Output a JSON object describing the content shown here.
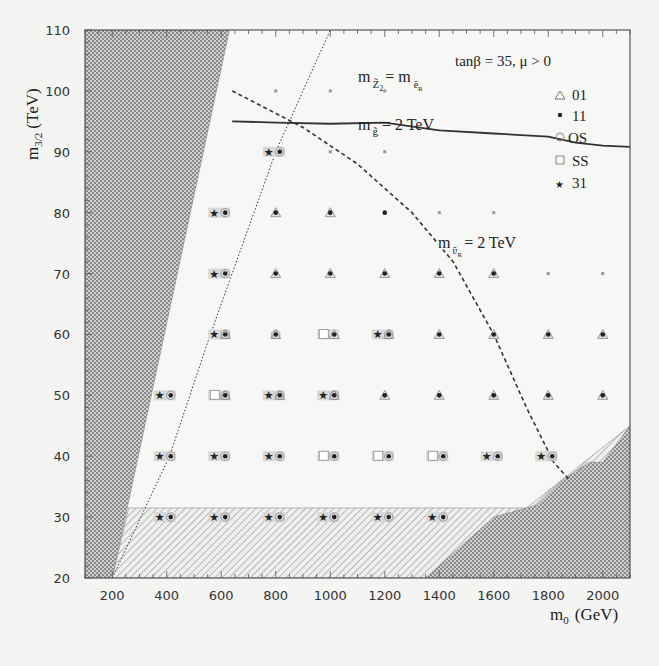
{
  "chart_data": {
    "type": "scatter",
    "title": "",
    "annotation_params": "tanβ = 35,  μ > 0",
    "xlabel": "m0 (GeV)",
    "ylabel": "m3/2 (TeV)",
    "xlim": [
      100,
      2100
    ],
    "ylim": [
      20,
      110
    ],
    "x_ticks": [
      200,
      400,
      600,
      800,
      1000,
      1200,
      1400,
      1600,
      1800,
      2000
    ],
    "y_ticks": [
      20,
      30,
      40,
      50,
      60,
      70,
      80,
      90,
      100,
      110
    ],
    "grid": false,
    "legend_position": "upper right",
    "legend": [
      {
        "symbol": "triangle-open",
        "label": "01"
      },
      {
        "symbol": "dot",
        "label": "11"
      },
      {
        "symbol": "circle-open",
        "label": "OS"
      },
      {
        "symbol": "square-open",
        "label": "SS"
      },
      {
        "symbol": "star",
        "label": "31"
      }
    ],
    "curve_labels": [
      {
        "text_main": "m",
        "sub": "Z̃2",
        "text_rest": "= m",
        "sub2": "ẽR",
        "position": [
          1000,
          103
        ]
      },
      {
        "text_main": "m",
        "sub": "g̃",
        "text_rest": "= 2 TeV",
        "position": [
          1000,
          96
        ]
      },
      {
        "text_main": "m",
        "sub": "ũR",
        "text_rest": "= 2 TeV",
        "position": [
          1380,
          74
        ]
      }
    ],
    "regions": [
      {
        "name": "theoretically excluded (left)",
        "fill": "crosshatch",
        "boundary": [
          [
            100,
            20
          ],
          [
            100,
            110
          ],
          [
            630,
            110
          ],
          [
            200,
            20
          ]
        ]
      },
      {
        "name": "experimentally excluded (bottom)",
        "fill": "diagonal-hatch",
        "boundary": [
          [
            200,
            20
          ],
          [
            260,
            31.5
          ],
          [
            1720,
            31.5
          ],
          [
            2100,
            45
          ],
          [
            2100,
            20
          ]
        ]
      },
      {
        "name": "theoretically excluded (bottom-right)",
        "fill": "crosshatch",
        "boundary": [
          [
            1350,
            20
          ],
          [
            1600,
            30
          ],
          [
            1760,
            32
          ],
          [
            1850,
            36
          ],
          [
            1950,
            39
          ],
          [
            2000,
            39
          ],
          [
            2050,
            42
          ],
          [
            2100,
            45
          ],
          [
            2100,
            20
          ]
        ]
      }
    ],
    "curves": [
      {
        "name": "m_gluino = 2 TeV",
        "style": "solid",
        "points": [
          [
            640,
            95
          ],
          [
            800,
            94.8
          ],
          [
            1000,
            94.6
          ],
          [
            1200,
            94.8
          ],
          [
            1400,
            93.5
          ],
          [
            1600,
            93
          ],
          [
            1800,
            92.5
          ],
          [
            1900,
            91.5
          ],
          [
            2000,
            91
          ],
          [
            2100,
            90.8
          ]
        ]
      },
      {
        "name": "m_uR = 2 TeV",
        "style": "dashed",
        "points": [
          [
            640,
            100
          ],
          [
            900,
            94
          ],
          [
            1100,
            88
          ],
          [
            1300,
            80
          ],
          [
            1450,
            72
          ],
          [
            1600,
            60
          ],
          [
            1720,
            48
          ],
          [
            1820,
            39
          ],
          [
            1880,
            36
          ]
        ]
      },
      {
        "name": "m_Z2 = m_eR",
        "style": "dotted",
        "points": [
          [
            200,
            20
          ],
          [
            410,
            40
          ],
          [
            560,
            60
          ],
          [
            800,
            90
          ],
          [
            1000,
            110
          ]
        ]
      }
    ],
    "series": [
      {
        "name": "signals",
        "points": [
          {
            "x": 800,
            "y": 100,
            "s": [
              "x"
            ]
          },
          {
            "x": 1000,
            "y": 100,
            "s": [
              "x"
            ]
          },
          {
            "x": 1200,
            "y": 100,
            "s": [
              "x"
            ]
          },
          {
            "x": 800,
            "y": 90,
            "s": [
              "31",
              "OS",
              "11"
            ]
          },
          {
            "x": 1000,
            "y": 90,
            "s": [
              "x"
            ]
          },
          {
            "x": 1200,
            "y": 90,
            "s": [
              "x"
            ]
          },
          {
            "x": 600,
            "y": 80,
            "s": [
              "31",
              "OS",
              "11"
            ]
          },
          {
            "x": 800,
            "y": 80,
            "s": [
              "11",
              "01"
            ]
          },
          {
            "x": 1000,
            "y": 80,
            "s": [
              "11",
              "01"
            ]
          },
          {
            "x": 1200,
            "y": 80,
            "s": [
              "11"
            ]
          },
          {
            "x": 1400,
            "y": 80,
            "s": [
              "x"
            ]
          },
          {
            "x": 1600,
            "y": 80,
            "s": [
              "x"
            ]
          },
          {
            "x": 600,
            "y": 70,
            "s": [
              "31",
              "OS",
              "11"
            ]
          },
          {
            "x": 800,
            "y": 70,
            "s": [
              "11",
              "01"
            ]
          },
          {
            "x": 1000,
            "y": 70,
            "s": [
              "11",
              "01"
            ]
          },
          {
            "x": 1200,
            "y": 70,
            "s": [
              "11",
              "01"
            ]
          },
          {
            "x": 1400,
            "y": 70,
            "s": [
              "11",
              "01"
            ]
          },
          {
            "x": 1600,
            "y": 70,
            "s": [
              "11",
              "01"
            ]
          },
          {
            "x": 1800,
            "y": 70,
            "s": [
              "x"
            ]
          },
          {
            "x": 2000,
            "y": 70,
            "s": [
              "x"
            ]
          },
          {
            "x": 600,
            "y": 60,
            "s": [
              "31",
              "OS",
              "11",
              "01"
            ]
          },
          {
            "x": 800,
            "y": 60,
            "s": [
              "OS",
              "11",
              "01"
            ]
          },
          {
            "x": 1000,
            "y": 60,
            "s": [
              "SS",
              "11",
              "01"
            ]
          },
          {
            "x": 1200,
            "y": 60,
            "s": [
              "31",
              "OS",
              "11",
              "01"
            ]
          },
          {
            "x": 1400,
            "y": 60,
            "s": [
              "11",
              "01"
            ]
          },
          {
            "x": 1600,
            "y": 60,
            "s": [
              "11",
              "01"
            ]
          },
          {
            "x": 1800,
            "y": 60,
            "s": [
              "11",
              "01"
            ]
          },
          {
            "x": 2000,
            "y": 60,
            "s": [
              "11",
              "01"
            ]
          },
          {
            "x": 400,
            "y": 50,
            "s": [
              "31",
              "OS",
              "11"
            ]
          },
          {
            "x": 600,
            "y": 50,
            "s": [
              "SS",
              "OS",
              "11",
              "01"
            ]
          },
          {
            "x": 800,
            "y": 50,
            "s": [
              "31",
              "OS",
              "11",
              "01"
            ]
          },
          {
            "x": 1000,
            "y": 50,
            "s": [
              "31",
              "OS",
              "11",
              "01"
            ]
          },
          {
            "x": 1200,
            "y": 50,
            "s": [
              "11",
              "01"
            ]
          },
          {
            "x": 1400,
            "y": 50,
            "s": [
              "11",
              "01"
            ]
          },
          {
            "x": 1600,
            "y": 50,
            "s": [
              "11",
              "01"
            ]
          },
          {
            "x": 1800,
            "y": 50,
            "s": [
              "11",
              "01"
            ]
          },
          {
            "x": 2000,
            "y": 50,
            "s": [
              "11",
              "01"
            ]
          },
          {
            "x": 400,
            "y": 40,
            "s": [
              "31",
              "OS",
              "11"
            ]
          },
          {
            "x": 600,
            "y": 40,
            "s": [
              "31",
              "OS",
              "11"
            ]
          },
          {
            "x": 800,
            "y": 40,
            "s": [
              "31",
              "OS",
              "11"
            ]
          },
          {
            "x": 1000,
            "y": 40,
            "s": [
              "SS",
              "OS",
              "11"
            ]
          },
          {
            "x": 1200,
            "y": 40,
            "s": [
              "SS",
              "OS",
              "11"
            ]
          },
          {
            "x": 1400,
            "y": 40,
            "s": [
              "SS",
              "OS",
              "11"
            ]
          },
          {
            "x": 1600,
            "y": 40,
            "s": [
              "31",
              "OS",
              "11"
            ]
          },
          {
            "x": 1800,
            "y": 40,
            "s": [
              "31",
              "OS",
              "11"
            ]
          },
          {
            "x": 400,
            "y": 30,
            "s": [
              "31",
              "OS",
              "11"
            ]
          },
          {
            "x": 600,
            "y": 30,
            "s": [
              "31",
              "OS",
              "11"
            ]
          },
          {
            "x": 800,
            "y": 30,
            "s": [
              "31",
              "OS",
              "11"
            ]
          },
          {
            "x": 1000,
            "y": 30,
            "s": [
              "31",
              "OS",
              "11"
            ]
          },
          {
            "x": 1200,
            "y": 30,
            "s": [
              "31",
              "OS",
              "11"
            ]
          },
          {
            "x": 1400,
            "y": 30,
            "s": [
              "31",
              "OS",
              "11"
            ]
          }
        ]
      }
    ]
  },
  "labels": {
    "params": "tanβ = 35,  μ > 0",
    "xlabel_m": "m",
    "xlabel_sub": "0",
    "xlabel_unit": "(GeV)",
    "ylabel_m": "m",
    "ylabel_sub": "3/2",
    "ylabel_unit": "(TeV)",
    "legend": [
      "01",
      "11",
      "OS",
      "SS",
      "31"
    ],
    "lbl_z2_m": "m",
    "lbl_z2_sub": "Z̃",
    "lbl_z2_sub2": "2",
    "lbl_z2_eq": "= m",
    "lbl_z2_e": "ẽ",
    "lbl_z2_r": "R",
    "lbl_gl_m": "m",
    "lbl_gl_sub": "g̃",
    "lbl_gl_eq": "= 2 TeV",
    "lbl_ur_m": "m",
    "lbl_ur_sub": "ũ",
    "lbl_ur_r": "R",
    "lbl_ur_eq": "= 2 TeV"
  }
}
